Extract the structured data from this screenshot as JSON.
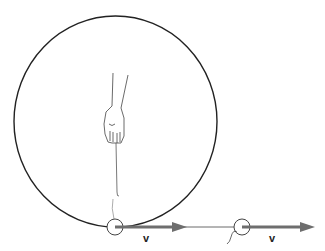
{
  "diagram": {
    "colors": {
      "outline": "#222222",
      "arrow": "#6e6e6e",
      "hand_fill": "#ffffff",
      "string": "#555555"
    },
    "labels": {
      "velocity_1": "v",
      "velocity_2": "v"
    },
    "circle_path": {
      "cx": 115.5,
      "cy": 121.5,
      "rx": 101.5,
      "ry": 105.5
    },
    "balls": [
      {
        "name": "ball-at-release",
        "cx": 115,
        "cy": 227,
        "r": 8
      },
      {
        "name": "ball-after-release",
        "cx": 242,
        "cy": 227,
        "r": 8
      }
    ],
    "arrows": [
      {
        "name": "velocity-arrow-1",
        "x1": 123,
        "y1": 227,
        "x2": 186,
        "y2": 227
      },
      {
        "name": "velocity-arrow-2",
        "x1": 250,
        "y1": 227,
        "x2": 314,
        "y2": 227
      }
    ]
  }
}
